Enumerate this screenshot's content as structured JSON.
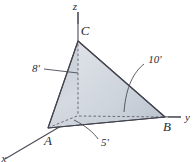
{
  "figure": {
    "background_color": "#ffffff",
    "line_color": "#44444f",
    "hidden_line_color": "#6a6a78",
    "face_colors": {
      "left_face": "#b9c0ca",
      "front_face": "#ccd2da",
      "right_face": "#d7dce2",
      "base_face": "#c3cad3"
    },
    "axes": [
      {
        "name": "z",
        "label": "z",
        "direction": "up"
      },
      {
        "name": "y",
        "label": "y",
        "direction": "right"
      },
      {
        "name": "x",
        "label": "x",
        "direction": "lower-left"
      }
    ],
    "vertices": [
      {
        "name": "A",
        "label": "A"
      },
      {
        "name": "B",
        "label": "B"
      },
      {
        "name": "C",
        "label": "C"
      }
    ],
    "dimensions": [
      {
        "name": "height-z",
        "label": "8'",
        "value": 8,
        "unit": "ft"
      },
      {
        "name": "edge-y",
        "label": "10'",
        "value": 10,
        "unit": "ft"
      },
      {
        "name": "edge-x",
        "label": "5'",
        "value": 5,
        "unit": "ft"
      }
    ]
  }
}
